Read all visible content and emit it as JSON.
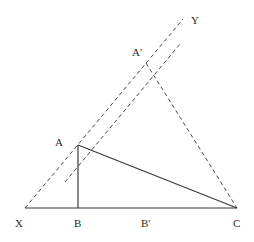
{
  "diagram": {
    "labels": {
      "Y": "Y",
      "A_prime": "A'",
      "A": "A",
      "X": "X",
      "B": "B",
      "B_prime": "B'",
      "C": "C"
    },
    "points": {
      "X": [
        25,
        208
      ],
      "B": [
        78,
        208
      ],
      "C": [
        237,
        208
      ],
      "A": [
        78,
        145
      ],
      "A_prime": [
        146,
        63
      ],
      "Y_end": [
        183,
        19
      ]
    },
    "colors": {
      "line": "#3a3a3a",
      "dashed": "#4a4a4a"
    }
  }
}
